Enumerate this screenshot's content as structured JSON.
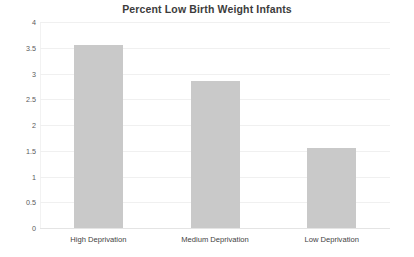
{
  "chart_data": {
    "type": "bar",
    "title": "Percent Low Birth Weight Infants",
    "xlabel": "",
    "ylabel": "",
    "categories": [
      "High Deprivation",
      "Medium Deprivation",
      "Low Deprivation"
    ],
    "values": [
      3.55,
      2.85,
      1.55
    ],
    "ylim": [
      0,
      4
    ],
    "ytick_step": 0.5,
    "yticks": [
      "4",
      "3.5",
      "3",
      "2.5",
      "2",
      "1.5",
      "1",
      "0.5",
      "0"
    ],
    "ytick_values": [
      4,
      3.5,
      3,
      2.5,
      2,
      1.5,
      1,
      0.5,
      0
    ],
    "grid": true,
    "grid_axis": "y",
    "legend": false,
    "series": [
      {
        "name": "Percent Low Birth Weight Infants",
        "values": [
          3.55,
          2.85,
          1.55
        ],
        "color": "#c9c9c9"
      }
    ],
    "colors": {
      "bar": "#c9c9c9",
      "grid": "#f0f0f0",
      "axis": "#e4e4e4",
      "title_text": "#3c3c3c",
      "tick_text": "#5a5a5a",
      "category_text": "#3f3f3f",
      "background": "#ffffff"
    }
  }
}
